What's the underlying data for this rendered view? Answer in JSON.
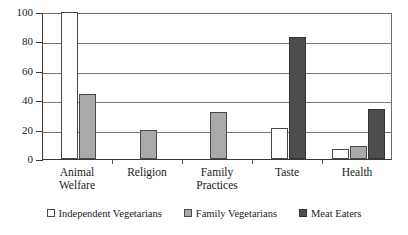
{
  "chart_data": {
    "type": "bar",
    "title": "",
    "subtitle": "",
    "xlabel": "",
    "ylabel": "",
    "ylim": [
      0,
      100
    ],
    "yticks": [
      0,
      20,
      40,
      60,
      80,
      100
    ],
    "ytick_labels": [
      "0",
      "20",
      "40",
      "60",
      "80",
      "100"
    ],
    "grid": true,
    "legend_position": "bottom",
    "categories": [
      "Animal Welfare",
      "Religion",
      "Family Practices",
      "Taste",
      "Health"
    ],
    "category_lines": [
      [
        "Animal",
        "Welfare"
      ],
      [
        "Religion"
      ],
      [
        "Family",
        "Practices"
      ],
      [
        "Taste"
      ],
      [
        "Health"
      ]
    ],
    "series": [
      {
        "name": "Independent Vegetarians",
        "color": "#ffffff",
        "values": [
          100,
          0,
          0,
          21,
          7
        ]
      },
      {
        "name": "Family Vegetarians",
        "color": "#a9a9a9",
        "values": [
          44,
          20,
          32,
          0,
          9
        ]
      },
      {
        "name": "Meat Eaters",
        "color": "#4d4d4d",
        "values": [
          0,
          0,
          0,
          83,
          34
        ]
      }
    ]
  },
  "legend": {
    "items": [
      {
        "label": "Independent Vegetarians",
        "swatch": "white-square-swatch"
      },
      {
        "label": "Family Vegetarians",
        "swatch": "gray-square-swatch"
      },
      {
        "label": "Meat Eaters",
        "swatch": "dark-square-swatch"
      }
    ]
  },
  "axes": {
    "y_tick_labels": [
      "100",
      "80",
      "60",
      "40",
      "20",
      "0"
    ],
    "x_tick_labels": [
      "Animal Welfare",
      "Religion",
      "Family Practices",
      "Taste",
      "Health"
    ]
  }
}
